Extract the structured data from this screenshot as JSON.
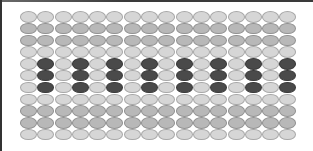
{
  "diagram": {
    "type": "bead-grid-pattern",
    "columns": 16,
    "rows": 11,
    "colors": {
      "light": "#d6d6d6",
      "medium": "#b8b8b8",
      "dark": "#4a4a4a",
      "background": "#ffffff"
    },
    "row_shades": [
      "light",
      "medium",
      "medium",
      "light",
      "light",
      "light",
      "light",
      "light",
      "medium",
      "medium",
      "light"
    ],
    "dark_rows": [
      5,
      6,
      7
    ],
    "dark_columns": [
      2,
      4,
      6,
      8,
      10,
      12,
      14,
      16
    ]
  }
}
